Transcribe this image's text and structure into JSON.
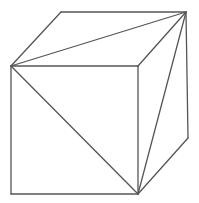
{
  "diagram": {
    "stroke_color": "#555555",
    "background": "#ffffff",
    "vertices": {
      "front_top_left": [
        11,
        66
      ],
      "front_top_right": [
        138,
        66
      ],
      "front_bottom_left": [
        11,
        194
      ],
      "front_bottom_right": [
        138,
        194
      ],
      "back_top_left": [
        61,
        12
      ],
      "back_top_right": [
        186,
        12
      ],
      "back_bottom_right": [
        188,
        138
      ]
    },
    "edges": [
      {
        "name": "front-top-edge",
        "from": "front_top_left",
        "to": "front_top_right"
      },
      {
        "name": "front-left-edge",
        "from": "front_top_left",
        "to": "front_bottom_left"
      },
      {
        "name": "front-bottom-edge",
        "from": "front_bottom_left",
        "to": "front_bottom_right"
      },
      {
        "name": "front-right-edge",
        "from": "front_top_right",
        "to": "front_bottom_right"
      },
      {
        "name": "top-left-edge",
        "from": "front_top_left",
        "to": "back_top_left"
      },
      {
        "name": "top-back-edge",
        "from": "back_top_left",
        "to": "back_top_right"
      },
      {
        "name": "top-right-edge",
        "from": "front_top_right",
        "to": "back_top_right"
      },
      {
        "name": "back-right-edge",
        "from": "back_top_right",
        "to": "back_bottom_right"
      },
      {
        "name": "bottom-right-edge",
        "from": "front_bottom_right",
        "to": "back_bottom_right"
      }
    ],
    "diagonals": [
      {
        "name": "top-face-diagonal",
        "from": "front_top_left",
        "to": "back_top_right"
      },
      {
        "name": "front-face-diagonal",
        "from": "front_top_left",
        "to": "front_bottom_right"
      },
      {
        "name": "right-face-diagonal",
        "from": "front_bottom_right",
        "to": "back_top_right"
      }
    ]
  }
}
